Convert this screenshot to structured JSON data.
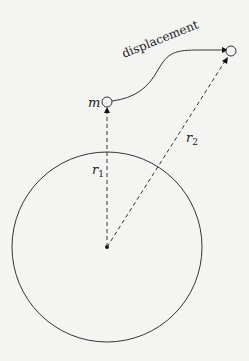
{
  "diagram": {
    "labels": {
      "displacement": "displacement",
      "mass": "m",
      "r1": "r",
      "r1_sub": "1",
      "r2": "r",
      "r2_sub": "2"
    },
    "colors": {
      "stroke": "#222222",
      "background": "#f4f4f2"
    }
  }
}
